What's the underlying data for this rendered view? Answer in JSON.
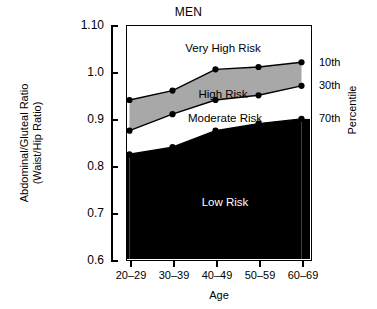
{
  "chart_data": {
    "type": "area",
    "title": "MEN",
    "xlabel": "Age",
    "ylabel_line1": "Abdominal/Gluteal Ratio",
    "ylabel_line2": "(Waist/Hip Ratio)",
    "right_axis_label": "Percentile",
    "categories": [
      "20–29",
      "30–39",
      "40–49",
      "50–59",
      "60–69"
    ],
    "ylim": [
      0.6,
      1.1
    ],
    "yticks": [
      1.1,
      1.0,
      0.9,
      0.8,
      0.7,
      0.6
    ],
    "ytick_labels": [
      "1.10",
      "1.0",
      "0.9",
      "0.8",
      "0.7",
      "0.6"
    ],
    "grid": false,
    "legend": "none",
    "series": [
      {
        "name": "10th percentile",
        "right_label": "10th",
        "values": [
          0.94,
          0.96,
          1.005,
          1.01,
          1.02
        ]
      },
      {
        "name": "30th percentile",
        "right_label": "30th",
        "values": [
          0.875,
          0.91,
          0.94,
          0.95,
          0.97
        ]
      },
      {
        "name": "70th percentile",
        "right_label": "70th",
        "values": [
          0.825,
          0.84,
          0.875,
          0.89,
          0.9
        ]
      }
    ],
    "bands": [
      {
        "name": "Very High Risk",
        "label": "Very High Risk",
        "fill": "#ffffff",
        "above": "10th percentile"
      },
      {
        "name": "High Risk",
        "label": "High Risk",
        "fill": "#a8a8a8",
        "between": [
          "10th percentile",
          "30th percentile"
        ]
      },
      {
        "name": "Moderate Risk",
        "label": "Moderate Risk",
        "fill": "#ffffff",
        "between": [
          "30th percentile",
          "70th percentile"
        ]
      },
      {
        "name": "Low Risk",
        "label": "Low Risk",
        "fill": "#000000",
        "below": "70th percentile"
      }
    ],
    "colors": {
      "axis": "#000000",
      "high_risk_band": "#a8a8a8",
      "low_risk_band": "#000000",
      "background": "#ffffff",
      "marker": "#000000"
    }
  }
}
